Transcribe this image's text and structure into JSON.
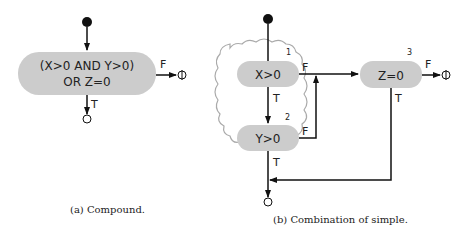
{
  "colors": {
    "node_fill": "#cccccc",
    "line": "#111111",
    "cloud": "#aaaaaa"
  },
  "compound": {
    "node_line1": "(X>0 AND Y>0)",
    "node_line2": "OR Z=0",
    "false_label": "F",
    "true_label": "T",
    "caption": "(a)  Compound."
  },
  "simple": {
    "nodes": [
      {
        "number": "1",
        "label": "X>0",
        "false_label": "F",
        "true_label": "T"
      },
      {
        "number": "2",
        "label": "Y>0",
        "false_label": "F",
        "true_label": "T"
      },
      {
        "number": "3",
        "label": "Z=0",
        "false_label": "F",
        "true_label": "T"
      }
    ],
    "caption": "(b)  Combination of simple."
  }
}
